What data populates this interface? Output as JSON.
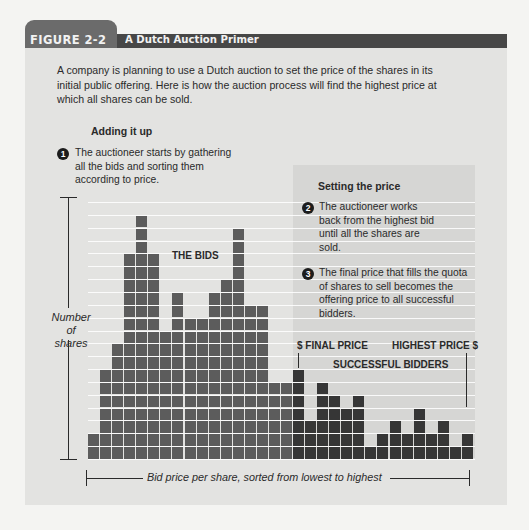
{
  "header": {
    "figure_label": "FIGURE 2-2",
    "title": "A Dutch Auction Primer"
  },
  "intro": "A company is planning to use a Dutch auction to set the price of the shares in its initial public offering. Here is how the auction process will find the highest price at which all shares can be sold.",
  "sections": {
    "adding": {
      "heading": "Adding it up",
      "step_number": "1",
      "step_text": "The auctioneer starts by gathering all the bids and sorting them according to price."
    },
    "setting": {
      "heading": "Setting the price",
      "steps": [
        {
          "number": "2",
          "text": "The auctioneer works back from the highest bid until all the shares are sold."
        },
        {
          "number": "3",
          "text": "The final price that fills the quota of shares to sell becomes the offering price to all successful bidders."
        }
      ]
    }
  },
  "labels": {
    "the_bids": "THE BIDS",
    "final_price": "$ FINAL PRICE",
    "highest_price": "HIGHEST PRICE $",
    "successful_bidders": "SUCCESSFUL BIDDERS",
    "y_axis": "Number of shares",
    "x_axis": "Bid price per share, sorted from lowest to highest"
  },
  "colors": {
    "unsuccessful_bids": "#5c5c5c",
    "successful_bids": "#363636",
    "header_tab": "#6b6b6b",
    "header_bar": "#474747",
    "panel": "#e3e3e1",
    "shaded_region": "#d6d6d4"
  },
  "chart_data": {
    "type": "bar",
    "title": "A Dutch Auction Primer",
    "xlabel": "Bid price per share, sorted from lowest to highest",
    "ylabel": "Number of shares",
    "grid": true,
    "ylim": [
      0,
      20
    ],
    "categories": [
      "1",
      "2",
      "3",
      "4",
      "5",
      "6",
      "7",
      "8",
      "9",
      "10",
      "11",
      "12",
      "13",
      "14",
      "15",
      "16",
      "17",
      "18",
      "19",
      "20",
      "21",
      "22",
      "23",
      "24",
      "25",
      "26",
      "27",
      "28",
      "29",
      "30",
      "31",
      "32"
    ],
    "values": [
      2,
      7,
      9,
      16,
      19,
      16,
      10,
      13,
      11,
      11,
      13,
      14,
      18,
      12,
      12,
      6,
      6,
      7,
      3,
      6,
      5,
      4,
      5,
      1,
      2,
      3,
      2,
      4,
      2,
      3,
      1,
      2
    ],
    "successful_from_index": 17,
    "annotations": [
      "THE BIDS",
      "$ FINAL PRICE",
      "HIGHEST PRICE $",
      "SUCCESSFUL BIDDERS"
    ]
  }
}
